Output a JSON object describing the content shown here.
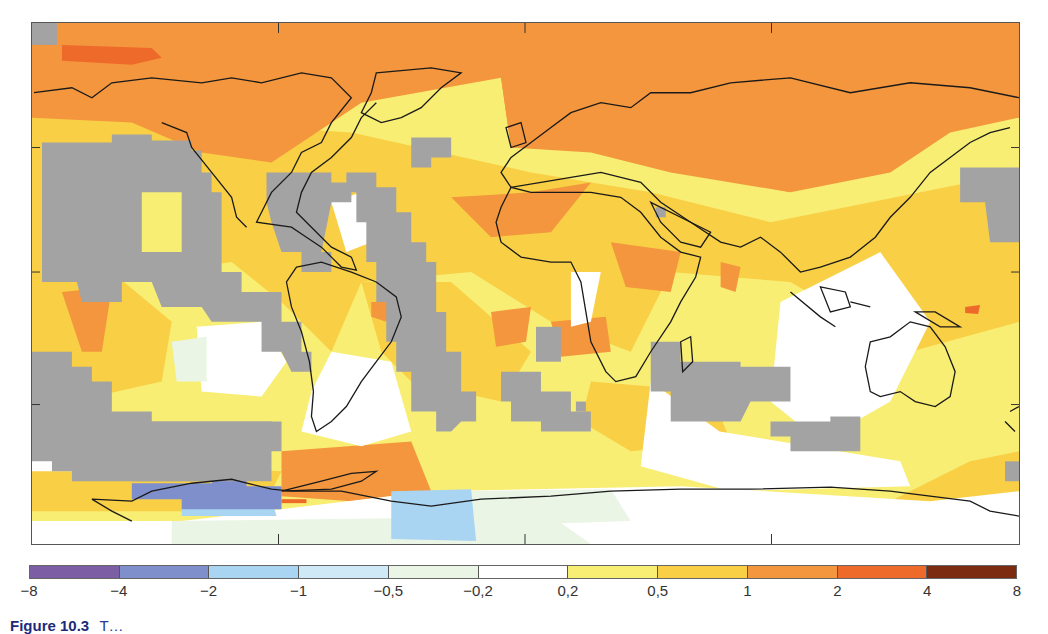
{
  "chart_data": {
    "type": "heatmap",
    "subtype": "global temperature anomaly map",
    "title": "",
    "xlabel": "",
    "ylabel": "",
    "legend": {
      "position": "bottom",
      "boundaries": [
        "−8",
        "−4",
        "−2",
        "−1",
        "−0,5",
        "−0,2",
        "0,2",
        "0,5",
        "1",
        "2",
        "4",
        "8"
      ],
      "bins": [
        {
          "range": [
            -8,
            -4
          ],
          "color": "#7b5ea3"
        },
        {
          "range": [
            -4,
            -2
          ],
          "color": "#7f8fcb"
        },
        {
          "range": [
            -2,
            -1
          ],
          "color": "#a9d4f2"
        },
        {
          "range": [
            -1,
            -0.5
          ],
          "color": "#cfe9f7"
        },
        {
          "range": [
            -0.5,
            -0.2
          ],
          "color": "#eaf5e6"
        },
        {
          "range": [
            -0.2,
            0.2
          ],
          "color": "#ffffff"
        },
        {
          "range": [
            0.2,
            0.5
          ],
          "color": "#f8ee74"
        },
        {
          "range": [
            0.5,
            1
          ],
          "color": "#f9cf45"
        },
        {
          "range": [
            1,
            2
          ],
          "color": "#f4963d"
        },
        {
          "range": [
            2,
            4
          ],
          "color": "#ee6a2b"
        },
        {
          "range": [
            4,
            8
          ],
          "color": "#7c2a10"
        }
      ],
      "no_data_color": "#a3a3a3"
    },
    "regions_summary": [
      {
        "region": "Arctic / northern high latitudes",
        "bin": "1 to 2",
        "note": "small 2 to 4 patch over Beaufort Sea"
      },
      {
        "region": "Northern Eurasia & Siberia",
        "bin": "1 to 2"
      },
      {
        "region": "North Atlantic / Greenland",
        "bin": "0.5 to 1"
      },
      {
        "region": "North Africa & Arabia",
        "bin": "0.5 to 1",
        "note": "1 to 2 patches over NW Africa, Sahel/Horn of Africa"
      },
      {
        "region": "Central & East Pacific",
        "bin": "no data",
        "note": "large gray areas"
      },
      {
        "region": "Southern Ocean near Antarctic Peninsula",
        "bin": "1 to 2"
      },
      {
        "region": "West Antarctica / Ross Sea coast",
        "bin": "-4 to -2",
        "note": "with -2 to -1 band"
      },
      {
        "region": "East Antarctica interior",
        "bin": "-0.5 to 0.2"
      },
      {
        "region": "Australia & Indian Ocean",
        "bin": "0.2 to 1",
        "note": "near-zero band NW of Australia"
      }
    ]
  },
  "legend": {
    "ticks": [
      "−8",
      "−4",
      "−2",
      "−1",
      "−0,5",
      "−0,2",
      "0,2",
      "0,5",
      "1",
      "2",
      "4",
      "8"
    ]
  },
  "caption": {
    "figure_number": "Figure 10.3",
    "text": "T…"
  }
}
